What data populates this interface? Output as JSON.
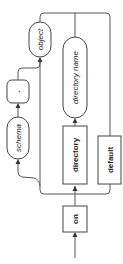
{
  "diagram": {
    "type": "railroad-syntax-diagram",
    "orientation": "vertical-rotated",
    "nodes": {
      "on": {
        "label": "on",
        "kind": "keyword"
      },
      "directory": {
        "label": "directory",
        "kind": "keyword"
      },
      "default": {
        "label": "default",
        "kind": "keyword"
      },
      "directory_name": {
        "label": "directory name",
        "kind": "identifier"
      },
      "schema": {
        "label": "schema",
        "kind": "identifier"
      },
      "dot": {
        "label": ".",
        "kind": "literal"
      },
      "object": {
        "label": "object",
        "kind": "identifier"
      }
    },
    "colors": {
      "line": "#555555",
      "node_border": "#444444",
      "text": "#222222",
      "background": "#ffffff"
    }
  }
}
